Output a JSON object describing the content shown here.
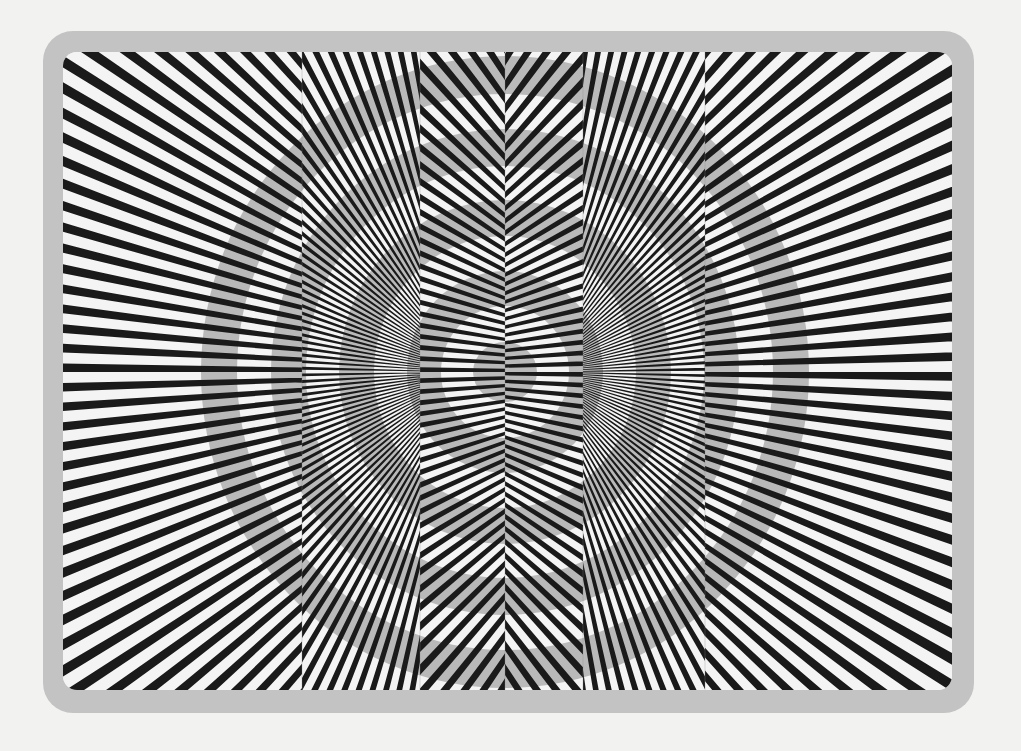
{
  "image": {
    "subject": "optical illusion: concentric gray rings over radiating black and white stripes split into vertical panels",
    "colors": {
      "page_background": "#f2f2f1",
      "frame": "#c3c3c3",
      "stripe_light": "#f4f4f4",
      "stripe_dark": "#1a1a1a",
      "ring_gray": "#b9b9b9"
    },
    "art_area": {
      "x": 63,
      "y": 52,
      "width": 889,
      "height": 638
    },
    "center": {
      "x": 505,
      "y": 372
    },
    "rings": [
      {
        "inner_rx": 0,
        "outer_rx": 32,
        "inner_ry": 0,
        "outer_ry": 30
      },
      {
        "inner_rx": 64,
        "outer_rx": 98,
        "inner_ry": 66,
        "outer_ry": 101
      },
      {
        "inner_rx": 131,
        "outer_rx": 166,
        "inner_ry": 136,
        "outer_ry": 172
      },
      {
        "inner_rx": 199,
        "outer_rx": 234,
        "inner_ry": 206,
        "outer_ry": 243
      },
      {
        "inner_rx": 268,
        "outer_rx": 304,
        "inner_ry": 278,
        "outer_ry": 316
      }
    ],
    "stripes": {
      "angle_step_deg": 2.25,
      "dark_width_ratio": 0.44
    },
    "panels": [
      {
        "name": "panel-far-left",
        "x0": 63,
        "x1": 302,
        "focus_x": 560,
        "focus_y": 372,
        "phase": 0.0
      },
      {
        "name": "panel-left",
        "x0": 302,
        "x1": 420,
        "focus_x": 470,
        "focus_y": 372,
        "phase": 0.35
      },
      {
        "name": "panel-center-left",
        "x0": 420,
        "x1": 505,
        "focus_x": 700,
        "focus_y": 372,
        "phase": 0.0
      },
      {
        "name": "panel-center-right",
        "x0": 505,
        "x1": 583,
        "focus_x": 310,
        "focus_y": 372,
        "phase": 0.0
      },
      {
        "name": "panel-right",
        "x0": 583,
        "x1": 705,
        "focus_x": 540,
        "focus_y": 372,
        "phase": 0.35
      },
      {
        "name": "panel-far-right",
        "x0": 705,
        "x1": 952,
        "focus_x": 450,
        "focus_y": 372,
        "phase": 0.0
      }
    ]
  }
}
